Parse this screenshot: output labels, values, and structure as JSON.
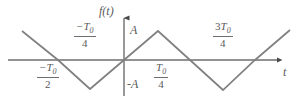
{
  "figure": {
    "title": "",
    "background_color": "#ffffff",
    "curve_color": "#808080",
    "axis_color": "#6e6e6e",
    "text_color": "#5a5a5a"
  },
  "axes": {
    "vertical_axis_label": "f(t)",
    "horizontal_axis_label": "t",
    "amplitude_positive_label": "A",
    "amplitude_negative_label": "-A",
    "origin_x": 124,
    "origin_y": 60
  },
  "tick_labels": [
    {
      "name": "neg-half-T0",
      "sign": "−",
      "numerator": "T",
      "subscript": "0",
      "denominator": "2",
      "x": 37,
      "y": 62
    },
    {
      "name": "neg-quarter-T0",
      "sign": "−",
      "numerator": "T",
      "subscript": "0",
      "denominator": "4",
      "x": 74,
      "y": 21
    },
    {
      "name": "pos-quarter-T0",
      "sign": "",
      "numerator": "T",
      "subscript": "0",
      "denominator": "4",
      "x": 154,
      "y": 62
    },
    {
      "name": "three-quarter-T0",
      "sign": "3",
      "numerator": "T",
      "subscript": "0",
      "denominator": "4",
      "x": 213,
      "y": 21
    }
  ],
  "chart_data": {
    "type": "line",
    "title": "",
    "xlabel": "t",
    "ylabel": "f(t)",
    "subtype": "triangular-wave",
    "amplitude": "A",
    "period": "T0",
    "grid": false,
    "legend": null,
    "xlim": [
      -0.75,
      1.1
    ],
    "ylim": [
      -1.25,
      1.25
    ],
    "y_tick_labels": [
      "A",
      "-A"
    ],
    "x_tick_labels": [
      "-T0/2",
      "-T0/4",
      "T0/4",
      "3T0/4"
    ],
    "x": [
      -0.6875,
      -0.5,
      -0.25,
      0,
      0.25,
      0.5,
      0.75,
      1.0,
      1.0625
    ],
    "y": [
      0.75,
      0,
      -1,
      0,
      1,
      0,
      -1,
      0,
      0.25
    ],
    "vertices_px": [
      {
        "x": 22,
        "y": 31
      },
      {
        "x": 58,
        "y": 60
      },
      {
        "x": 90,
        "y": 89
      },
      {
        "x": 124,
        "y": 60
      },
      {
        "x": 158,
        "y": 31
      },
      {
        "x": 190,
        "y": 60
      },
      {
        "x": 223,
        "y": 90
      },
      {
        "x": 255,
        "y": 60
      },
      {
        "x": 290,
        "y": 30
      }
    ]
  }
}
